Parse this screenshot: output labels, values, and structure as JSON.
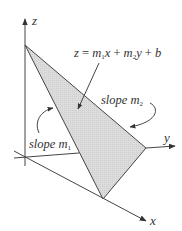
{
  "figure": {
    "type": "3d-plane-diagram",
    "axes": {
      "x_label": "x",
      "y_label": "y",
      "z_label": "z"
    },
    "equation": {
      "lhs": "z",
      "eq": "=",
      "m1": "m",
      "m1_sub": "1",
      "x": "x",
      "plus1": "+",
      "m2": "m",
      "m2_sub": "2",
      "y": "y",
      "plus2": "+",
      "b": "b",
      "full_text": "z = m1x + m2y + b"
    },
    "annotations": {
      "slope_m1": {
        "word": "slope",
        "var": "m",
        "sub": "1"
      },
      "slope_m2": {
        "word": "slope",
        "var": "m",
        "sub": "2"
      }
    },
    "colors": {
      "plane_fill": "#d9d9d9",
      "lines": "#444444",
      "text": "#333333"
    }
  }
}
